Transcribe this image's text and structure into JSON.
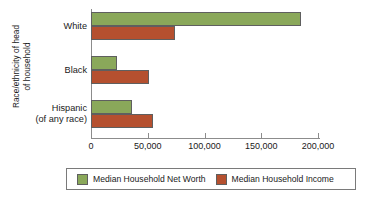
{
  "chart_data": {
    "type": "bar",
    "orientation": "horizontal",
    "title": "",
    "xlabel": "",
    "ylabel": "Race/ethnicity of head\nof household",
    "categories": [
      "White",
      "Black",
      "Hispanic\n(of any race)"
    ],
    "series": [
      {
        "name": "Median Household Net Worth",
        "color": "#8aa85a",
        "values": [
          185000,
          23000,
          36000
        ]
      },
      {
        "name": "Median Household Income",
        "color": "#b5502f",
        "values": [
          74000,
          51000,
          55000
        ]
      }
    ],
    "xlim": [
      0,
      200000
    ],
    "xticks": [
      0,
      50000,
      100000,
      150000,
      200000
    ],
    "xtick_labels": [
      "0",
      "50,000",
      "100,000",
      "150,000",
      "200,000"
    ],
    "grid": false,
    "legend_position": "bottom"
  },
  "axis": {
    "y_title": "Race/ethnicity of head\nof household",
    "tick_labels": [
      "0",
      "50,000",
      "100,000",
      "150,000",
      "200,000"
    ]
  },
  "categories": {
    "white": "White",
    "black": "Black",
    "hispanic": "Hispanic\n(of any race)"
  },
  "legend": {
    "net_worth_label": "Median Household Net Worth",
    "income_label": "Median Household Income"
  },
  "colors": {
    "net_worth": "#8aa85a",
    "income": "#b5502f",
    "axis": "#8c8c8c",
    "bar_outline": "#5f5f5f"
  }
}
